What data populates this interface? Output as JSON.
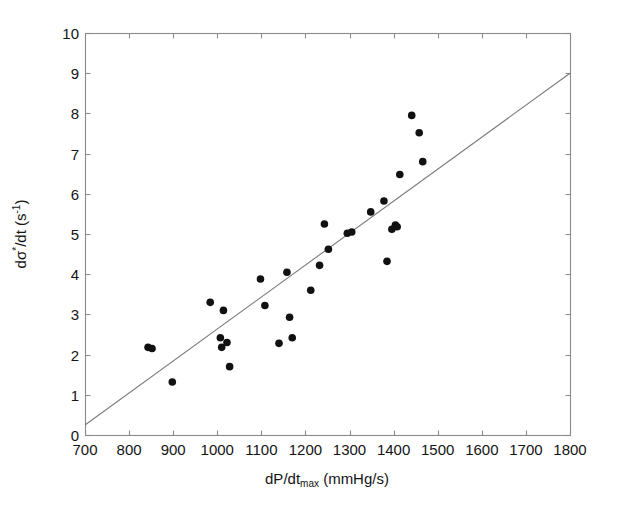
{
  "chart_data": {
    "type": "scatter",
    "title": "",
    "xlabel": "dP/dt_max (mmHg/s)",
    "ylabel": "dσ*/dt (s^-1)",
    "xlabel_parts": {
      "main": "dP/dt",
      "sub": "max",
      "unit": " (mmHg/s)"
    },
    "ylabel_parts": {
      "lead": "d",
      "sigma": "σ",
      "star": "*",
      "mid": "/dt (s",
      "exp": "-1",
      "tail": ")"
    },
    "xlim": [
      700,
      1800
    ],
    "ylim": [
      0,
      10
    ],
    "xticks": [
      700,
      800,
      900,
      1000,
      1100,
      1200,
      1300,
      1400,
      1500,
      1600,
      1700,
      1800
    ],
    "yticks": [
      0,
      1,
      2,
      3,
      4,
      5,
      6,
      7,
      8,
      9,
      10
    ],
    "grid": false,
    "legend": null,
    "marker": {
      "shape": "circle",
      "color": "#111111",
      "size": 5
    },
    "points": [
      {
        "x": 843,
        "y": 2.18
      },
      {
        "x": 852,
        "y": 2.15
      },
      {
        "x": 898,
        "y": 1.32
      },
      {
        "x": 984,
        "y": 3.3
      },
      {
        "x": 1007,
        "y": 2.42
      },
      {
        "x": 1010,
        "y": 2.18
      },
      {
        "x": 1014,
        "y": 3.1
      },
      {
        "x": 1022,
        "y": 2.3
      },
      {
        "x": 1028,
        "y": 1.7
      },
      {
        "x": 1098,
        "y": 3.88
      },
      {
        "x": 1108,
        "y": 3.22
      },
      {
        "x": 1140,
        "y": 2.28
      },
      {
        "x": 1158,
        "y": 4.05
      },
      {
        "x": 1164,
        "y": 2.93
      },
      {
        "x": 1170,
        "y": 2.42
      },
      {
        "x": 1212,
        "y": 3.6
      },
      {
        "x": 1232,
        "y": 4.22
      },
      {
        "x": 1243,
        "y": 5.25
      },
      {
        "x": 1252,
        "y": 4.62
      },
      {
        "x": 1295,
        "y": 5.02
      },
      {
        "x": 1305,
        "y": 5.05
      },
      {
        "x": 1348,
        "y": 5.55
      },
      {
        "x": 1378,
        "y": 5.82
      },
      {
        "x": 1385,
        "y": 4.32
      },
      {
        "x": 1396,
        "y": 5.12
      },
      {
        "x": 1404,
        "y": 5.22
      },
      {
        "x": 1408,
        "y": 5.18
      },
      {
        "x": 1414,
        "y": 6.48
      },
      {
        "x": 1441,
        "y": 7.95
      },
      {
        "x": 1458,
        "y": 7.52
      },
      {
        "x": 1466,
        "y": 6.8
      }
    ],
    "fit_line": {
      "x_start": 700,
      "y_start": 0.25,
      "x_end": 1800,
      "y_end": 9.0,
      "color": "#7a7a7a"
    }
  },
  "axes": {
    "left_px": 85,
    "right_px": 570,
    "top_px": 33,
    "bottom_px": 435,
    "frame_color": "#8a8a8a"
  }
}
